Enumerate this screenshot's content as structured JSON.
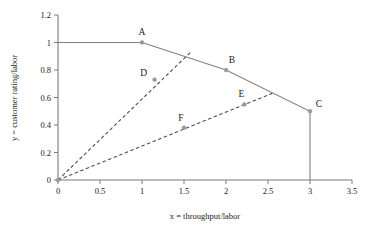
{
  "chart_data": {
    "type": "line",
    "title": "",
    "xlabel": "x = throughput/labor",
    "ylabel": "y = customer rating/labor",
    "xlim": [
      0,
      3.5
    ],
    "ylim": [
      0,
      1.2
    ],
    "xticks": [
      "0",
      "0.5",
      "1",
      "1.5",
      "2",
      "2.5",
      "3",
      "3.5"
    ],
    "xtick_values": [
      0,
      0.5,
      1,
      1.5,
      2,
      2.5,
      3,
      3.5
    ],
    "yticks": [
      "0",
      "0.2",
      "0.4",
      "0.6",
      "0.8",
      "1",
      "1.2"
    ],
    "ytick_values": [
      0,
      0.2,
      0.4,
      0.6,
      0.8,
      1,
      1.2
    ],
    "grid": false,
    "legend": "none",
    "series": [
      {
        "name": "efficient frontier",
        "style": "solid",
        "color": "#808080",
        "x": [
          0,
          1,
          2,
          3,
          3
        ],
        "y": [
          1,
          1,
          0.8,
          0.5,
          0
        ]
      },
      {
        "name": "ray through D",
        "style": "dashed",
        "color": "#4d4d4d",
        "x": [
          0,
          1.58
        ],
        "y": [
          0,
          0.93
        ]
      },
      {
        "name": "ray through F and E",
        "style": "dashed",
        "color": "#4d4d4d",
        "x": [
          0,
          2.55
        ],
        "y": [
          0,
          0.63
        ]
      }
    ],
    "points": [
      {
        "label": "A",
        "x": 1.0,
        "y": 1.0,
        "label_dx": 0,
        "label_dy": -8,
        "on_frontier": true
      },
      {
        "label": "B",
        "x": 2.0,
        "y": 0.8,
        "label_dx": 6,
        "label_dy": -7,
        "on_frontier": true
      },
      {
        "label": "C",
        "x": 3.0,
        "y": 0.5,
        "label_dx": 9,
        "label_dy": -4,
        "on_frontier": true
      },
      {
        "label": "D",
        "x": 1.15,
        "y": 0.73,
        "label_dx": -11,
        "label_dy": -4,
        "on_frontier": false
      },
      {
        "label": "E",
        "x": 2.22,
        "y": 0.55,
        "label_dx": -3,
        "label_dy": -7,
        "on_frontier": false
      },
      {
        "label": "F",
        "x": 1.5,
        "y": 0.38,
        "label_dx": -3,
        "label_dy": -7,
        "on_frontier": false
      },
      {
        "label": "",
        "x": 0.0,
        "y": 0.0,
        "label_dx": 0,
        "label_dy": 0,
        "on_frontier": false
      }
    ]
  },
  "colors": {
    "axis": "#7a7a7a",
    "frontier": "#808080",
    "dashed": "#4d4d4d",
    "marker": "#999999",
    "text": "#1a1a1a",
    "background": "#ffffff"
  }
}
